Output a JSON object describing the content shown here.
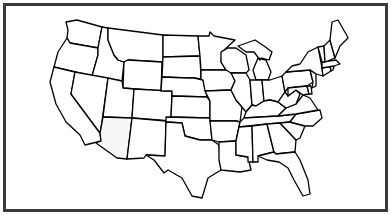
{
  "map": {
    "title": "",
    "type": "outline",
    "region": "Contiguous United States",
    "colors": {
      "frame": "#3a3a3a",
      "stroke": "#000000",
      "fill": "#ffffff",
      "highlight_fill": "#f7f7f7"
    },
    "highlighted_state": "Arizona"
  }
}
